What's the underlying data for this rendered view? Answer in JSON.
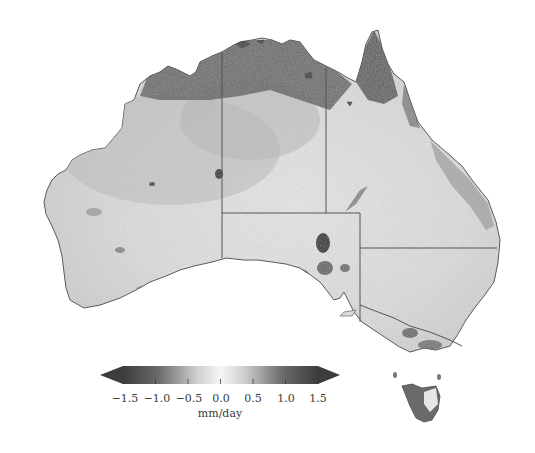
{
  "map": {
    "region": "Australia",
    "variable_unit": "mm/day",
    "regions_shown": [
      "Western Australia",
      "Northern Territory",
      "Queensland",
      "South Australia",
      "New South Wales",
      "Victoria",
      "Tasmania"
    ],
    "colors": {
      "low": "#3d3d3d",
      "mid": "#f4f4f4",
      "high": "#3d3d3d",
      "border": "#555555",
      "land_base": "#d6d6d6"
    }
  },
  "colorbar": {
    "unit": "mm/day",
    "ticks": [
      "−1.5",
      "−1.0",
      "−0.5",
      "0.0",
      "0.5",
      "1.0",
      "1.5"
    ],
    "tick_values": [
      -1.5,
      -1.0,
      -0.5,
      0.0,
      0.5,
      1.0,
      1.5
    ],
    "range": [
      -1.5,
      1.5
    ],
    "extend": "both",
    "cmap": "dark-gray to white to dark-gray (diverging grayscale)"
  }
}
